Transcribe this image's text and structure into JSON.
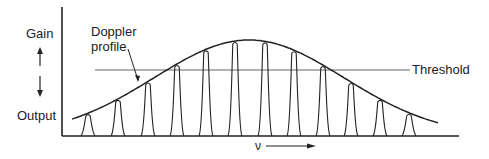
{
  "diagram": {
    "y_axis_labels": {
      "top": "Gain",
      "bottom": "Output"
    },
    "profile_label": {
      "line1": "Doppler",
      "line2": "profile"
    },
    "threshold_label": "Threshold",
    "x_axis_label": "ν",
    "colors": {
      "line": "#222222",
      "threshold": "#555555",
      "background": "#ffffff"
    },
    "modes": {
      "count": 12,
      "positions_x": [
        88,
        118,
        148,
        177,
        206,
        235,
        265,
        294,
        323,
        351,
        380,
        409
      ]
    }
  }
}
